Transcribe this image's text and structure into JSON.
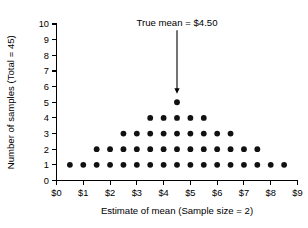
{
  "chart_data": {
    "type": "scatter",
    "title": "",
    "xlabel": "Estimate of mean (Sample size = 2)",
    "ylabel": "Number of samples (Total = 45)",
    "xlim": [
      0,
      9
    ],
    "ylim": [
      0,
      10
    ],
    "grid": false,
    "legend": "none",
    "x_ticks": [
      0,
      1,
      2,
      3,
      4,
      5,
      6,
      7,
      8,
      9
    ],
    "x_tick_labels": [
      "$0",
      "$1",
      "$2",
      "$3",
      "$4",
      "$5",
      "$6",
      "$7",
      "$8",
      "$9"
    ],
    "y_ticks": [
      0,
      1,
      2,
      3,
      4,
      5,
      6,
      7,
      8,
      9,
      10
    ],
    "y_tick_labels": [
      "0",
      "1",
      "2",
      "3",
      "4",
      "5",
      "6",
      "7",
      "8",
      "9",
      "10"
    ],
    "dot_color": "#111111",
    "columns": [
      {
        "x": 0.5,
        "count": 1
      },
      {
        "x": 1.0,
        "count": 1
      },
      {
        "x": 1.5,
        "count": 2
      },
      {
        "x": 2.0,
        "count": 2
      },
      {
        "x": 2.5,
        "count": 3
      },
      {
        "x": 3.0,
        "count": 3
      },
      {
        "x": 3.5,
        "count": 4
      },
      {
        "x": 4.0,
        "count": 4
      },
      {
        "x": 4.5,
        "count": 5
      },
      {
        "x": 5.0,
        "count": 4
      },
      {
        "x": 5.5,
        "count": 4
      },
      {
        "x": 6.0,
        "count": 3
      },
      {
        "x": 6.5,
        "count": 3
      },
      {
        "x": 7.0,
        "count": 2
      },
      {
        "x": 7.5,
        "count": 2
      },
      {
        "x": 8.0,
        "count": 1
      },
      {
        "x": 8.5,
        "count": 1
      }
    ],
    "rows": [
      {
        "y": 1,
        "x_start": 0.5,
        "x_end": 8.5,
        "n_dots": 17
      },
      {
        "y": 2,
        "x_start": 1.5,
        "x_end": 7.5,
        "n_dots": 13
      },
      {
        "y": 3,
        "x_start": 2.5,
        "x_end": 6.5,
        "n_dots": 9
      },
      {
        "y": 4,
        "x_start": 3.5,
        "x_end": 5.5,
        "n_dots": 5
      },
      {
        "y": 5,
        "x_start": 4.5,
        "x_end": 4.5,
        "n_dots": 1
      }
    ],
    "total_samples": 45,
    "annotations": [
      {
        "text": "True mean = $4.50",
        "x": 4.5,
        "arrow_from_y": 9.6,
        "arrow_to_y": 5.55
      }
    ]
  }
}
